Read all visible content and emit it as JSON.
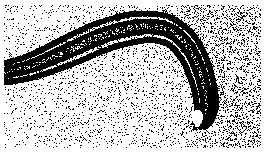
{
  "figure": {
    "domain": "Natural-Image",
    "kind": "electron-micrograph",
    "render_style": "dithered-halftone-bitonal",
    "caption": "",
    "title": "",
    "width": 265,
    "height": 153,
    "colors": {
      "ink": "#000000",
      "paper": "#ffffff",
      "background_field": "#ffffff"
    },
    "margins": {
      "left": 4,
      "right": 4,
      "top": 5,
      "bottom": 5
    },
    "background": {
      "name": "stippled-noise-field",
      "description": "Random black dither speckle over white, density varies across the plate",
      "density_zones": [
        {
          "name": "top-left",
          "x": 0,
          "y": 0,
          "w": 90,
          "h": 45,
          "density": 0.045
        },
        {
          "name": "top-center",
          "x": 90,
          "y": 0,
          "w": 90,
          "h": 30,
          "density": 0.12
        },
        {
          "name": "top-right",
          "x": 180,
          "y": 0,
          "w": 85,
          "h": 60,
          "density": 0.3
        },
        {
          "name": "mid-right",
          "x": 195,
          "y": 55,
          "w": 70,
          "h": 55,
          "density": 0.26
        },
        {
          "name": "bottom-right",
          "x": 205,
          "y": 105,
          "w": 60,
          "h": 48,
          "density": 0.4
        },
        {
          "name": "bottom-center",
          "x": 60,
          "y": 95,
          "w": 145,
          "h": 58,
          "density": 0.11
        },
        {
          "name": "bottom-left",
          "x": 0,
          "y": 95,
          "w": 60,
          "h": 58,
          "density": 0.07
        },
        {
          "name": "left-mid",
          "x": 0,
          "y": 40,
          "w": 60,
          "h": 55,
          "density": 0.09
        }
      ],
      "base_density": 0.1,
      "dot_size_px": 1
    },
    "subject": {
      "name": "filament",
      "label": "banded filamentous structure",
      "description": "Long S-curved multilayered fiber entering at the left edge, arcing up across the middle and hooking sharply downward at the right, terminating in a rounded tip containing a white lumen",
      "orientation": "left-to-right sigmoid then downward hook",
      "band_count": 4,
      "centerline": [
        [
          0,
          74
        ],
        [
          14,
          71
        ],
        [
          30,
          67
        ],
        [
          46,
          61
        ],
        [
          62,
          54
        ],
        [
          80,
          46
        ],
        [
          98,
          38
        ],
        [
          116,
          32
        ],
        [
          134,
          28
        ],
        [
          150,
          27
        ],
        [
          164,
          29
        ],
        [
          176,
          35
        ],
        [
          186,
          45
        ],
        [
          194,
          58
        ],
        [
          200,
          73
        ],
        [
          204,
          88
        ],
        [
          206,
          100
        ],
        [
          206,
          110
        ],
        [
          203,
          118
        ],
        [
          198,
          123
        ]
      ],
      "half_width": [
        9,
        10,
        11,
        12,
        13,
        14,
        14,
        14,
        14,
        13,
        13,
        12,
        12,
        11,
        11,
        10,
        10,
        9,
        8,
        6
      ],
      "bands": [
        {
          "name": "outer-upper-band",
          "offset": -1.0,
          "thickness": 2.6,
          "tone": "black"
        },
        {
          "name": "inner-upper-band",
          "offset": -0.42,
          "thickness": 2.2,
          "tone": "black"
        },
        {
          "name": "inner-lower-band",
          "offset": 0.38,
          "thickness": 2.2,
          "tone": "black"
        },
        {
          "name": "outer-lower-band",
          "offset": 1.0,
          "thickness": 2.6,
          "tone": "black"
        }
      ],
      "interior": {
        "name": "axial-core",
        "tone": "mottled-light",
        "description": "Lighter speckled core between the inner bands, with fine cross-striations"
      },
      "striations": {
        "name": "cross-striations",
        "count": 58,
        "description": "Short transverse ticks crossing the core between the inner bands"
      }
    },
    "tip": {
      "name": "hooked-terminus",
      "x": 199,
      "y": 120,
      "lumen": {
        "name": "white-lumen",
        "shape": "teardrop",
        "cx": 197,
        "cy": 118,
        "rx": 4.5,
        "ry": 8,
        "tone": "white"
      },
      "halo": {
        "name": "dense-halo",
        "cx": 200,
        "cy": 120,
        "r": 26,
        "density": 0.42
      }
    },
    "annotations": [],
    "scale_bar": null,
    "axis_labels": []
  }
}
